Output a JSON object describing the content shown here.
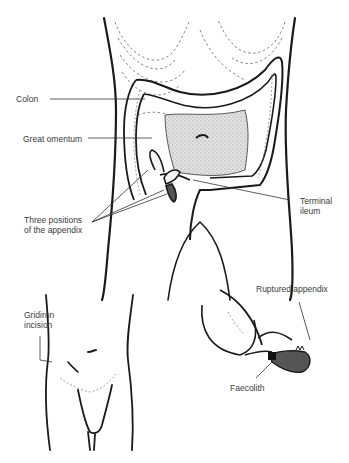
{
  "figure": {
    "main_panel": {
      "title": "Abdomen with colon and appendix positions",
      "labels": {
        "colon": "Colon",
        "great_omentum": "Great omentum",
        "three_positions_line1": "Three positions",
        "three_positions_line2": "of the appendix",
        "terminal_ileum_line1": "Terminal",
        "terminal_ileum_line2": "ileum"
      }
    },
    "lower_left_panel": {
      "labels": {
        "gridiron_line1": "Gridiron",
        "gridiron_line2": "incision"
      }
    },
    "lower_right_panel": {
      "labels": {
        "ruptured_appendix": "Ruptured appendix",
        "faecolith": "Faecolith"
      }
    },
    "colors": {
      "ink": "#1a1a1a",
      "text": "#3a3a3a",
      "omentum_fill": "#cfcfcf",
      "appendix_fill": "#555555"
    }
  }
}
